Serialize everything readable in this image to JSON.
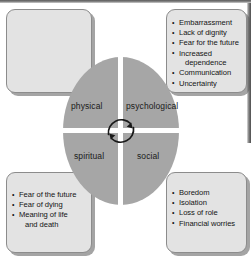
{
  "figure": {
    "type": "four-quadrant cycle diagram",
    "center": {
      "icon": "circular-cycle-arrow-icon",
      "fill_color": "#a6a6a6",
      "divider_color": "#ffffff",
      "quadrants": [
        {
          "id": "physical",
          "label": "physical",
          "position": "top-left"
        },
        {
          "id": "psychological",
          "label": "psychological",
          "position": "top-right"
        },
        {
          "id": "spiritual",
          "label": "spiritual",
          "position": "bottom-left"
        },
        {
          "id": "social",
          "label": "social",
          "position": "bottom-right"
        }
      ]
    },
    "boxes": [
      {
        "id": "physical-box",
        "position": "top-left",
        "linked_quadrant": "physical",
        "items": []
      },
      {
        "id": "psychological-box",
        "position": "top-right",
        "linked_quadrant": "psychological",
        "items": [
          {
            "text": "Embarrassment"
          },
          {
            "text": "Lack of dignity"
          },
          {
            "text": "Fear for the future"
          },
          {
            "text": "Increased",
            "continuation": "dependence"
          },
          {
            "text": "Communication"
          },
          {
            "text": "Uncertainty"
          }
        ]
      },
      {
        "id": "spiritual-box",
        "position": "bottom-left",
        "linked_quadrant": "spiritual",
        "items": [
          {
            "text": "Fear of the future"
          },
          {
            "text": "Fear of dying"
          },
          {
            "text": "Meaning of life",
            "continuation": "and death"
          }
        ]
      },
      {
        "id": "social-box",
        "position": "bottom-right",
        "linked_quadrant": "social",
        "items": [
          {
            "text": "Boredom"
          },
          {
            "text": "Isolation"
          },
          {
            "text": "Loss of role"
          },
          {
            "text": "Financial worries"
          }
        ]
      }
    ],
    "colors": {
      "box_fill": "#e3e3e3",
      "box_border": "#8c8c8c",
      "circle_fill": "#a6a6a6",
      "text": "#141414",
      "background": "#ffffff"
    }
  }
}
